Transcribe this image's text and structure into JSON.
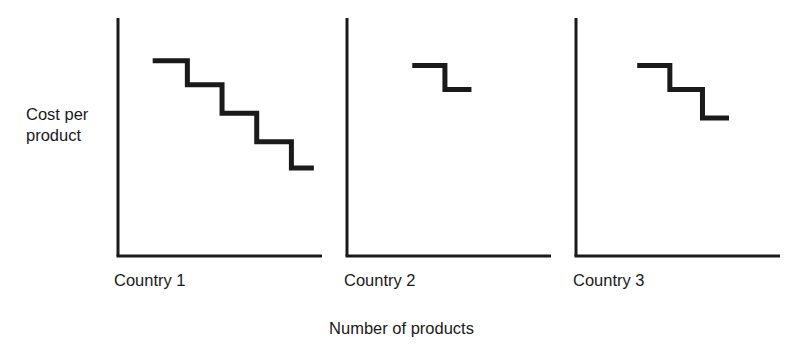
{
  "figure": {
    "y_axis_label": "Cost per\nproduct",
    "x_axis_label": "Number of products",
    "line_color": "#1a1a1a",
    "axis_color": "#1a1a1a",
    "background_color": "#ffffff"
  },
  "panels": [
    {
      "label": "Country 1"
    },
    {
      "label": "Country 2"
    },
    {
      "label": "Country 3"
    }
  ],
  "chart_data": {
    "type": "line",
    "title": "",
    "subtitle": "",
    "xlabel": "Number of products",
    "ylabel": "Cost per product",
    "grid": false,
    "legend": null,
    "axis_ticks": {
      "x": [],
      "y": []
    },
    "axis_arrow": false,
    "note": "Three side-by-side step (staircase) curves illustrating economies of scale: cost per product falls in discrete steps as the number of products rises. Country 1 shows the longest, steepest decline (5 steps); Country 2 the shortest (2 steps); Country 3 intermediate (3 steps). No numeric tick labels appear on either axis.",
    "panels": [
      {
        "name": "Country 1",
        "step_count": 5,
        "xlim": [
          0,
          100
        ],
        "ylim": [
          0,
          100
        ],
        "x": [
          17,
          34,
          34,
          51,
          51,
          68,
          68,
          85,
          85,
          96
        ],
        "y": [
          82,
          82,
          72,
          72,
          60,
          60,
          48,
          48,
          37,
          37
        ],
        "steps": [
          {
            "x_start": 17,
            "x_end": 34,
            "y": 82
          },
          {
            "x_start": 34,
            "x_end": 51,
            "y": 72
          },
          {
            "x_start": 51,
            "x_end": 68,
            "y": 60
          },
          {
            "x_start": 68,
            "x_end": 85,
            "y": 48
          },
          {
            "x_start": 85,
            "x_end": 96,
            "y": 37
          }
        ]
      },
      {
        "name": "Country 2",
        "step_count": 2,
        "xlim": [
          0,
          100
        ],
        "ylim": [
          0,
          100
        ],
        "x": [
          32,
          48,
          48,
          61
        ],
        "y": [
          80,
          80,
          70,
          70
        ],
        "steps": [
          {
            "x_start": 32,
            "x_end": 48,
            "y": 80
          },
          {
            "x_start": 48,
            "x_end": 61,
            "y": 70
          }
        ]
      },
      {
        "name": "Country 3",
        "step_count": 3,
        "xlim": [
          0,
          100
        ],
        "ylim": [
          0,
          100
        ],
        "x": [
          30,
          46,
          46,
          62,
          62,
          75
        ],
        "y": [
          80,
          80,
          70,
          70,
          58,
          58
        ],
        "steps": [
          {
            "x_start": 30,
            "x_end": 46,
            "y": 80
          },
          {
            "x_start": 46,
            "x_end": 62,
            "y": 70
          },
          {
            "x_start": 62,
            "x_end": 75,
            "y": 58
          }
        ]
      }
    ]
  }
}
